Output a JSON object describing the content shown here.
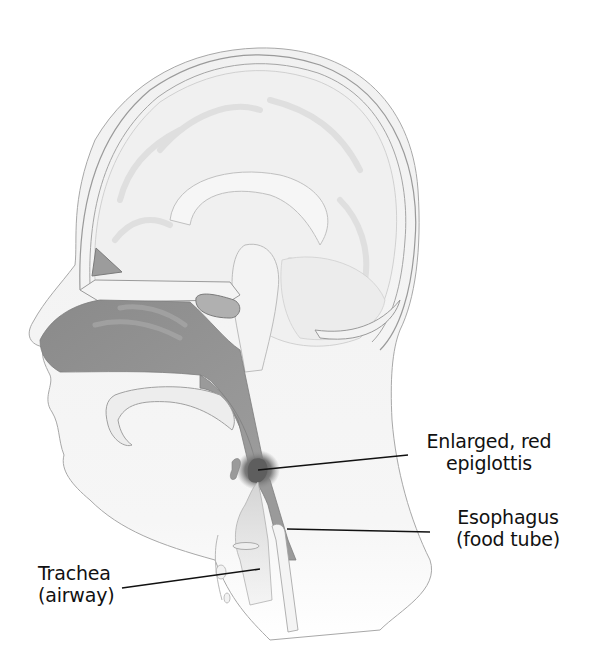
{
  "figure": {
    "colors": {
      "background": "#ffffff",
      "tissue_light": "#f2f2f2",
      "tissue_mid": "#e4e4e4",
      "airway_dark": "#8f8f8f",
      "outline": "#9a9a9a",
      "leader_line": "#111111",
      "label_text": "#111111"
    }
  },
  "labels": [
    {
      "id": "epiglottis",
      "lines": [
        "Enlarged, red",
        "epiglottis"
      ]
    },
    {
      "id": "esophagus",
      "lines": [
        "Esophagus",
        "(food tube)"
      ]
    },
    {
      "id": "trachea",
      "lines": [
        "Trachea",
        "(airway)"
      ]
    }
  ]
}
